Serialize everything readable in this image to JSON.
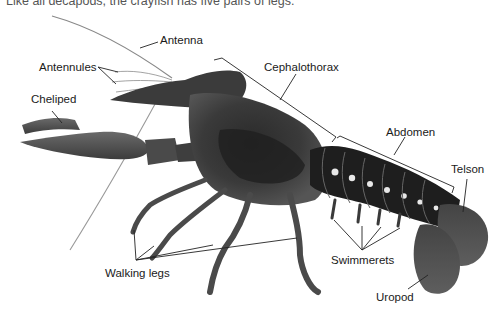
{
  "caption": "Like all decapods, the crayfish has five pairs of legs.",
  "figure": {
    "labels": [
      {
        "id": "antenna",
        "text": "Antenna"
      },
      {
        "id": "antennules",
        "text": "Antennules"
      },
      {
        "id": "cheliped",
        "text": "Cheliped"
      },
      {
        "id": "cephalothorax",
        "text": "Cephalothorax"
      },
      {
        "id": "abdomen",
        "text": "Abdomen"
      },
      {
        "id": "telson",
        "text": "Telson"
      },
      {
        "id": "walking_legs",
        "text": "Walking legs"
      },
      {
        "id": "swimmerets",
        "text": "Swimmerets"
      },
      {
        "id": "uropod",
        "text": "Uropod"
      }
    ]
  }
}
